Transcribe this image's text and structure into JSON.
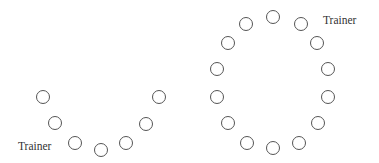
{
  "diagram": {
    "title": "",
    "seat_color": "#555555",
    "seat_radius": 7,
    "layouts": [
      {
        "name": "u-shape",
        "trainer_label": "Trainer",
        "trainer_position": {
          "x": 18,
          "y": 141
        },
        "seats": [
          {
            "x": 43,
            "y": 97
          },
          {
            "x": 55,
            "y": 123
          },
          {
            "x": 75,
            "y": 143
          },
          {
            "x": 101,
            "y": 150
          },
          {
            "x": 126,
            "y": 143
          },
          {
            "x": 146,
            "y": 124
          },
          {
            "x": 159,
            "y": 97
          }
        ]
      },
      {
        "name": "circle",
        "trainer_label": "Trainer",
        "trainer_position": {
          "x": 323,
          "y": 15
        },
        "seats": [
          {
            "x": 273,
            "y": 17
          },
          {
            "x": 301,
            "y": 24
          },
          {
            "x": 317,
            "y": 43
          },
          {
            "x": 328,
            "y": 69
          },
          {
            "x": 328,
            "y": 97
          },
          {
            "x": 318,
            "y": 123
          },
          {
            "x": 299,
            "y": 143
          },
          {
            "x": 273,
            "y": 148
          },
          {
            "x": 247,
            "y": 143
          },
          {
            "x": 228,
            "y": 123
          },
          {
            "x": 217,
            "y": 97
          },
          {
            "x": 217,
            "y": 69
          },
          {
            "x": 228,
            "y": 43
          },
          {
            "x": 246,
            "y": 24
          }
        ]
      }
    ]
  }
}
